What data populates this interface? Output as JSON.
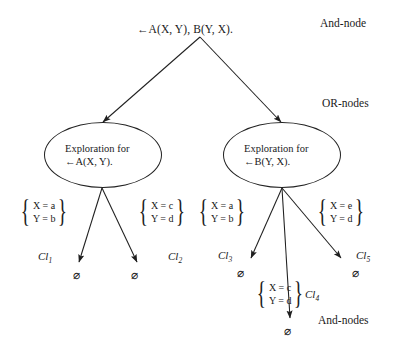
{
  "diagram": {
    "type": "and-or-search-tree",
    "root": {
      "label": "←A(X, Y), B(Y, X).",
      "kind": "and-node"
    },
    "annotations": {
      "and_node_top": "And-node",
      "or_nodes": "OR-nodes",
      "and_nodes_bottom": "And-nodes"
    },
    "or_nodes": [
      {
        "id": "or-left",
        "line1": "Exploration for",
        "line2": "←A(X, Y)."
      },
      {
        "id": "or-right",
        "line1": "Exploration for",
        "line2": "←B(Y, X)."
      }
    ],
    "substitutions": [
      {
        "id": "sub-left-1",
        "x": "X = a",
        "y": "Y = b"
      },
      {
        "id": "sub-left-2",
        "x": "X = c",
        "y": "Y = d"
      },
      {
        "id": "sub-right-1",
        "x": "X = a",
        "y": "Y = b"
      },
      {
        "id": "sub-right-3",
        "x": "X = e",
        "y": "Y = d"
      },
      {
        "id": "sub-right-2",
        "x": "X = c",
        "y": "Y = d"
      }
    ],
    "clause_labels": [
      {
        "id": "cl1",
        "base": "Cl",
        "index": "1"
      },
      {
        "id": "cl2",
        "base": "Cl",
        "index": "2"
      },
      {
        "id": "cl3",
        "base": "Cl",
        "index": "3"
      },
      {
        "id": "cl4",
        "base": "Cl",
        "index": "4"
      },
      {
        "id": "cl5",
        "base": "Cl",
        "index": "5"
      }
    ],
    "empty_clauses": [
      {
        "id": "empty-1",
        "symbol": "⌀"
      },
      {
        "id": "empty-2",
        "symbol": "⌀"
      },
      {
        "id": "empty-3",
        "symbol": "⌀"
      },
      {
        "id": "empty-4",
        "symbol": "⌀"
      },
      {
        "id": "empty-5",
        "symbol": "⌀"
      }
    ],
    "colors": {
      "stroke": "#222222",
      "text": "#1a1a1a",
      "background": "#ffffff"
    }
  }
}
